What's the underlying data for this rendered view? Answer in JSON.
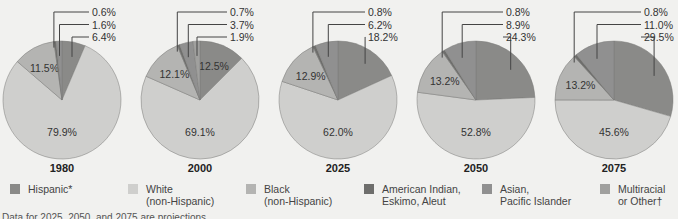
{
  "chart_data": {
    "type": "pie",
    "title": "",
    "categories": [
      "Hispanic*",
      "White (non-Hispanic)",
      "Black (non-Hispanic)",
      "American Indian, Eskimo, Aleut",
      "Asian, Pacific Islander",
      "Multiracial or Other†"
    ],
    "colors": {
      "Hispanic*": "#8a8a88",
      "White (non-Hispanic)": "#cfcfcd",
      "Black (non-Hispanic)": "#b4b4b2",
      "American Indian, Eskimo, Aleut": "#6e6e6c",
      "Asian, Pacific Islander": "#909090",
      "Multiracial or Other†": "#a0a09e"
    },
    "charts": [
      {
        "year": "1980",
        "slices": [
          {
            "category": "Hispanic*",
            "value": 6.4,
            "label": "6.4%",
            "callout": true
          },
          {
            "category": "White (non-Hispanic)",
            "value": 79.9,
            "label": "79.9%"
          },
          {
            "category": "Black (non-Hispanic)",
            "value": 11.5,
            "label": "11.5%"
          },
          {
            "category": "American Indian, Eskimo, Aleut",
            "value": 0.6,
            "label": "0.6%",
            "callout": true
          },
          {
            "category": "Asian, Pacific Islander",
            "value": 1.6,
            "label": "1.6%",
            "callout": true
          }
        ]
      },
      {
        "year": "2000",
        "slices": [
          {
            "category": "Hispanic*",
            "value": 12.5,
            "label": "12.5%"
          },
          {
            "category": "White (non-Hispanic)",
            "value": 69.1,
            "label": "69.1%"
          },
          {
            "category": "Black (non-Hispanic)",
            "value": 12.1,
            "label": "12.1%"
          },
          {
            "category": "American Indian, Eskimo, Aleut",
            "value": 0.7,
            "label": "0.7%",
            "callout": true
          },
          {
            "category": "Asian, Pacific Islander",
            "value": 3.7,
            "label": "3.7%",
            "callout": true
          },
          {
            "category": "Multiracial or Other†",
            "value": 1.9,
            "label": "1.9%",
            "callout": true
          }
        ]
      },
      {
        "year": "2025",
        "slices": [
          {
            "category": "Hispanic*",
            "value": 18.2,
            "label": "18.2%",
            "callout": true
          },
          {
            "category": "White (non-Hispanic)",
            "value": 62.0,
            "label": "62.0%"
          },
          {
            "category": "Black (non-Hispanic)",
            "value": 12.9,
            "label": "12.9%"
          },
          {
            "category": "American Indian, Eskimo, Aleut",
            "value": 0.8,
            "label": "0.8%",
            "callout": true
          },
          {
            "category": "Asian, Pacific Islander",
            "value": 6.2,
            "label": "6.2%",
            "callout": true
          }
        ]
      },
      {
        "year": "2050",
        "slices": [
          {
            "category": "Hispanic*",
            "value": 24.3,
            "label": "24.3%",
            "callout": true
          },
          {
            "category": "White (non-Hispanic)",
            "value": 52.8,
            "label": "52.8%"
          },
          {
            "category": "Black (non-Hispanic)",
            "value": 13.2,
            "label": "13.2%"
          },
          {
            "category": "American Indian, Eskimo, Aleut",
            "value": 0.8,
            "label": "0.8%",
            "callout": true
          },
          {
            "category": "Asian, Pacific Islander",
            "value": 8.9,
            "label": "8.9%",
            "callout": true
          }
        ]
      },
      {
        "year": "2075",
        "slices": [
          {
            "category": "Hispanic*",
            "value": 29.5,
            "label": "29.5%",
            "callout": true
          },
          {
            "category": "White (non-Hispanic)",
            "value": 45.6,
            "label": "45.6%"
          },
          {
            "category": "Black (non-Hispanic)",
            "value": 13.2,
            "label": "13.2%"
          },
          {
            "category": "American Indian, Eskimo, Aleut",
            "value": 0.8,
            "label": "0.8%",
            "callout": true
          },
          {
            "category": "Asian, Pacific Islander",
            "value": 11.0,
            "label": "11.0%",
            "callout": true
          }
        ]
      }
    ],
    "legend": [
      {
        "label": "Hispanic*",
        "color": "#8a8a88"
      },
      {
        "label": "White\n(non-Hispanic)",
        "color": "#cfcfcd"
      },
      {
        "label": "Black\n(non-Hispanic)",
        "color": "#b4b4b2"
      },
      {
        "label": "American Indian,\nEskimo, Aleut",
        "color": "#6e6e6c"
      },
      {
        "label": "Asian,\nPacific Islander",
        "color": "#909090"
      },
      {
        "label": "Multiracial\nor Other†",
        "color": "#a0a09e"
      }
    ],
    "legend_position": "bottom",
    "footnote": "Data for 2025, 2050, and 2075 are projections."
  },
  "layout": {
    "centers_x": [
      62,
      200,
      338,
      476,
      614
    ],
    "center_y": 100,
    "radius": 59
  }
}
